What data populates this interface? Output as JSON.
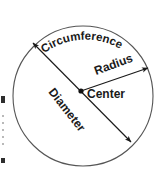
{
  "figure": {
    "type": "geometry-diagram",
    "background_color": "#ffffff",
    "stroke_color": "#555555",
    "label_color": "#1a1a1a",
    "circle": {
      "center_x": 83,
      "center_y": 96,
      "radius": 70
    },
    "labels": {
      "circumference": "Circumference",
      "radius": "Radius",
      "center": "Center",
      "diameter": "Diameter"
    },
    "label_rotation_degrees": {
      "circumference": "curved-along-arc",
      "radius": -20,
      "center": 0,
      "diameter": 52
    },
    "arrows": {
      "diameter": {
        "from_x": 33,
        "from_y": 43,
        "to_x": 131,
        "to_y": 142,
        "heads": "both"
      },
      "radius": {
        "from_x": 81,
        "from_y": 91,
        "to_x": 148,
        "to_y": 68,
        "heads": "end"
      }
    },
    "center_dot": {
      "x": 81,
      "y": 91,
      "r": 2.6
    }
  }
}
